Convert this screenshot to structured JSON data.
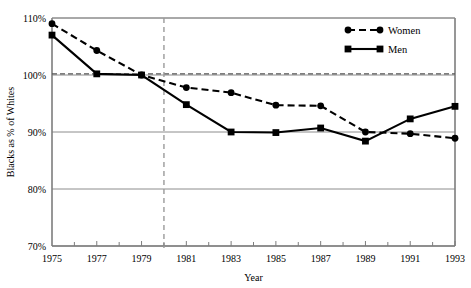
{
  "chart_data": {
    "type": "line",
    "title": "",
    "xlabel": "Year",
    "ylabel": "Blacks as % of Whites",
    "x": [
      1975,
      1977,
      1979,
      1981,
      1983,
      1985,
      1987,
      1989,
      1991,
      1993
    ],
    "xtick_labels": [
      "1975",
      "1977",
      "1979",
      "1981",
      "1983",
      "1985",
      "1987",
      "1989",
      "1991",
      "1993"
    ],
    "ytick_labels": [
      "70%",
      "80%",
      "90%",
      "100%",
      "110%"
    ],
    "ytick_values": [
      70,
      80,
      90,
      100,
      110
    ],
    "xlim": [
      1975,
      1993
    ],
    "ylim": [
      70,
      110
    ],
    "grid": "horizontal",
    "legend_position": "top-right",
    "series": [
      {
        "name": "Women",
        "marker": "circle",
        "linestyle": "dashed",
        "color": "#000000",
        "values": [
          109.0,
          104.3,
          100.0,
          97.8,
          96.9,
          94.7,
          94.6,
          90.0,
          89.7,
          88.9
        ]
      },
      {
        "name": "Men",
        "marker": "square",
        "linestyle": "solid",
        "color": "#000000",
        "values": [
          107.0,
          100.2,
          100.0,
          94.8,
          90.0,
          89.9,
          90.7,
          88.4,
          92.3,
          94.5
        ]
      }
    ],
    "reference_lines": [
      {
        "name": "parity-line",
        "orientation": "horizontal",
        "value": 100.2,
        "style": "dashed",
        "color": "#555555"
      },
      {
        "name": "year-marker-line",
        "orientation": "vertical",
        "value": 1980,
        "style": "dashed",
        "color": "#9a9a9a"
      }
    ],
    "gridline_color": "#8c8c8c",
    "axis_color": "#7d7d7d"
  },
  "legend": {
    "items": [
      {
        "label": "Women"
      },
      {
        "label": "Men"
      }
    ]
  }
}
